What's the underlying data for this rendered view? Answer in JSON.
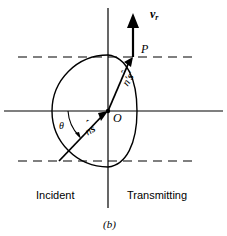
{
  "figure": {
    "caption": "(b)",
    "labels": {
      "ray_velocity_vector": "v",
      "ray_velocity_subscript": "r",
      "point_p": "P",
      "origin": "O",
      "angle_theta": "θ",
      "incident_wave_vector_n": "n",
      "incident_wave_vector_s": "s",
      "incident_wave_vector_hat": "ˆ",
      "transmitted_wave_vector_n": "n′",
      "transmitted_wave_vector_s": "s",
      "transmitted_wave_vector_hat": "ˆ",
      "transmitted_wave_vector_prime": "′",
      "region_left": "Incident",
      "region_right": "Transmitting"
    },
    "colors": {
      "stroke": "#000000",
      "background": "#ffffff"
    },
    "geometry": {
      "origin_x": 108,
      "origin_y": 111,
      "horizontal_axis_y": 111,
      "vertical_axis_x": 108,
      "vertical_axis_top": 8,
      "vertical_axis_bottom": 208,
      "upper_dashed_y": 57,
      "lower_dashed_y": 161,
      "dashed_x_start": 18,
      "dashed_x_end": 196,
      "incident_circle_radius": 56,
      "transmit_ellipse_rx": 22,
      "transmit_ellipse_ry": 56,
      "point_p_x": 133,
      "point_p_y": 57,
      "vector_tip_x": 133,
      "vector_tip_y": 18,
      "incident_ray_start_x": 59,
      "incident_ray_start_y": 161
    }
  }
}
